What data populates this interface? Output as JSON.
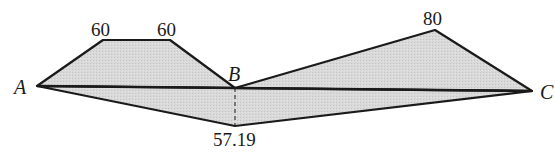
{
  "diagram": {
    "fill_color": "#d6d6d6",
    "stroke_color": "#1a1a1a",
    "points": {
      "A": {
        "label": "A"
      },
      "B": {
        "label": "B"
      },
      "C": {
        "label": "C"
      }
    },
    "values": {
      "upper_left_1": "60",
      "upper_left_2": "60",
      "upper_right": "80",
      "lower": "57.19"
    }
  }
}
